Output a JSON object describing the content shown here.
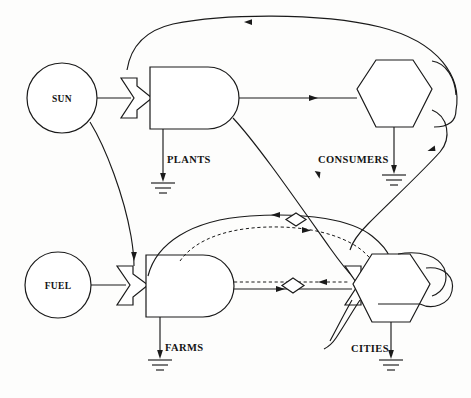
{
  "diagram": {
    "type": "odum-energy-systems",
    "background_color": "#fdfdfc",
    "line_color": "#1a1a1a",
    "nodes": {
      "sun": {
        "label": "SUN",
        "symbol": "source-circle"
      },
      "fuel": {
        "label": "FUEL",
        "symbol": "source-circle"
      },
      "plants": {
        "label": "PLANTS",
        "symbol": "producer-bullet"
      },
      "farms": {
        "label": "FARMS",
        "symbol": "producer-bullet"
      },
      "consumers": {
        "label": "CONSUMERS",
        "symbol": "consumer-hexagon"
      },
      "cities": {
        "label": "CITIES",
        "symbol": "consumer-hexagon"
      }
    },
    "symbols": {
      "interaction": "interaction-arrow",
      "heat_sink": "heat-sink-ground",
      "transaction": "transaction-diamond",
      "money_flow": "dashed-line",
      "energy_flow": "solid-line"
    },
    "legend_notes": {
      "solid": "energy flow",
      "dashed": "money flow",
      "diamond": "price transaction"
    }
  }
}
